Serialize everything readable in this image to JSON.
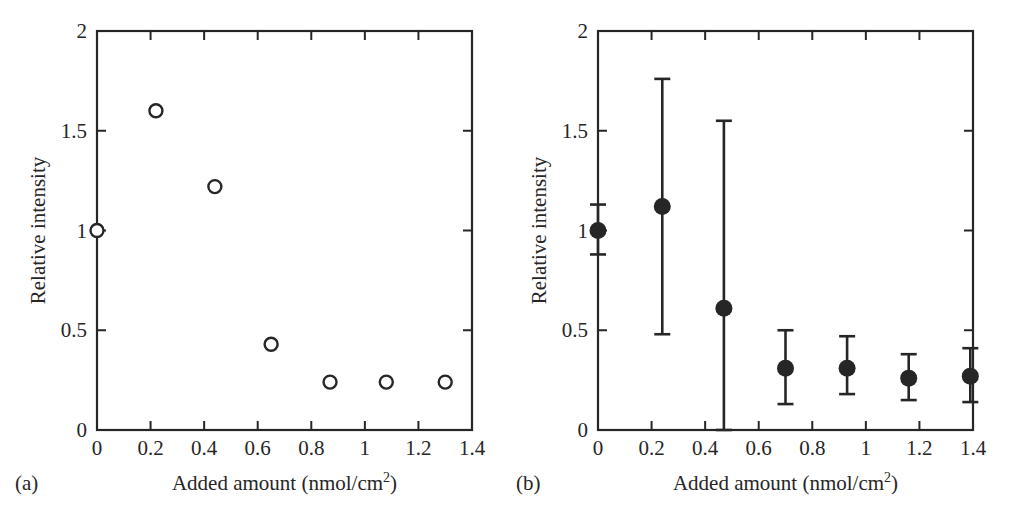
{
  "figure": {
    "background_color": "#ffffff",
    "ink_color": "#262626",
    "panels": [
      {
        "letter": "(a)",
        "marker_style": "open-circle",
        "xlabel_main": "Added amount (nmol/cm",
        "xlabel_sup": "2",
        "xlabel_close": ")",
        "ylabel": "Relative intensity",
        "xticklabels": [
          "0",
          "0.2",
          "0.4",
          "0.6",
          "0.8",
          "1",
          "1.2",
          "1.4"
        ],
        "yticklabels": [
          "0",
          "0.5",
          "1",
          "1.5",
          "2"
        ]
      },
      {
        "letter": "(b)",
        "marker_style": "filled-circle-errorbar",
        "xlabel_main": "Added amount (nmol/cm",
        "xlabel_sup": "2",
        "xlabel_close": ")",
        "ylabel": "Relative intensity",
        "xticklabels": [
          "0",
          "0.2",
          "0.4",
          "0.6",
          "0.8",
          "1",
          "1.2",
          "1.4"
        ],
        "yticklabels": [
          "0",
          "0.5",
          "1",
          "1.5",
          "2"
        ]
      }
    ]
  },
  "chart_data": [
    {
      "type": "scatter",
      "panel": "(a)",
      "title": "",
      "xlabel": "Added amount (nmol/cm2)",
      "ylabel": "Relative intensity",
      "xlim": [
        0,
        1.4
      ],
      "ylim": [
        0,
        2
      ],
      "xticks": [
        0,
        0.2,
        0.4,
        0.6,
        0.8,
        1,
        1.2,
        1.4
      ],
      "yticks": [
        0,
        0.5,
        1,
        1.5,
        2
      ],
      "grid": false,
      "legend": "none",
      "marker": "open circle",
      "x": [
        0.0,
        0.22,
        0.44,
        0.65,
        0.87,
        1.08,
        1.3
      ],
      "y": [
        1.0,
        1.6,
        1.22,
        0.43,
        0.24,
        0.24,
        0.24
      ]
    },
    {
      "type": "scatter",
      "panel": "(b)",
      "title": "",
      "xlabel": "Added amount (nmol/cm2)",
      "ylabel": "Relative intensity",
      "xlim": [
        0,
        1.4
      ],
      "ylim": [
        0,
        2
      ],
      "xticks": [
        0,
        0.2,
        0.4,
        0.6,
        0.8,
        1,
        1.2,
        1.4
      ],
      "yticks": [
        0,
        0.5,
        1,
        1.5,
        2
      ],
      "grid": false,
      "legend": "none",
      "marker": "filled circle with error bars",
      "x": [
        0.0,
        0.24,
        0.47,
        0.7,
        0.93,
        1.16,
        1.39
      ],
      "y": [
        1.0,
        1.12,
        0.61,
        0.31,
        0.31,
        0.26,
        0.27
      ],
      "yerr_upper": [
        0.13,
        0.64,
        0.94,
        0.19,
        0.16,
        0.12,
        0.14
      ],
      "yerr_lower": [
        0.12,
        0.64,
        0.61,
        0.18,
        0.13,
        0.11,
        0.13
      ],
      "notes": "Third point lower whisker is clipped at y=0 (extends to axis)."
    }
  ]
}
